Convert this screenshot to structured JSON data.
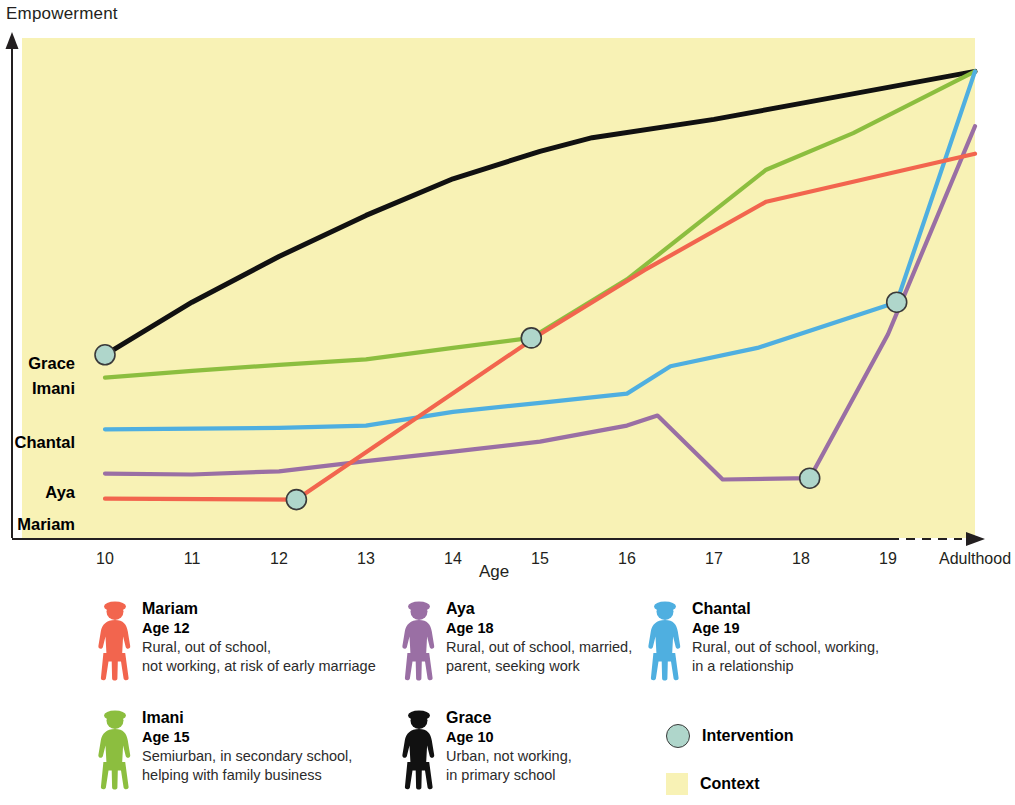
{
  "axes": {
    "y_title": "Empowerment",
    "x_title": "Age"
  },
  "chart_data": {
    "type": "line",
    "title": "Empowerment",
    "xlabel": "Age",
    "ylabel": "Empowerment",
    "x_tick_labels": [
      "10",
      "11",
      "12",
      "13",
      "14",
      "15",
      "16",
      "17",
      "18",
      "19",
      "Adulthood"
    ],
    "xlim": [
      10,
      20
    ],
    "ylim": [
      0,
      1
    ],
    "grid": false,
    "legend_position": "below",
    "background_color": "#F8F2B5",
    "annotations": [
      {
        "label": "Intervention",
        "marker": "circle",
        "fill": "#AFD6CB",
        "stroke": "#3a3a3a"
      },
      {
        "label": "Context",
        "marker": "square",
        "fill": "#F8F2B5"
      }
    ],
    "series": [
      {
        "name": "Grace",
        "color": "#111111",
        "inline_label": "Grace",
        "points": [
          [
            10,
            0.355
          ],
          [
            11,
            0.47
          ],
          [
            12,
            0.57
          ],
          [
            13,
            0.66
          ],
          [
            14,
            0.74
          ],
          [
            15,
            0.8
          ],
          [
            15.6,
            0.83
          ],
          [
            17,
            0.87
          ],
          [
            18,
            0.905
          ],
          [
            19,
            0.94
          ],
          [
            20,
            0.975
          ]
        ],
        "intervention_points": [
          [
            10,
            0.355
          ]
        ]
      },
      {
        "name": "Imani",
        "color": "#8CBE3F",
        "inline_label": "Imani",
        "points": [
          [
            10,
            0.305
          ],
          [
            11,
            0.32
          ],
          [
            12,
            0.333
          ],
          [
            13,
            0.345
          ],
          [
            14,
            0.37
          ],
          [
            14.9,
            0.392
          ],
          [
            16,
            0.52
          ],
          [
            17.6,
            0.76
          ],
          [
            18.6,
            0.84
          ],
          [
            20,
            0.975
          ]
        ],
        "intervention_points": [
          [
            14.9,
            0.392
          ]
        ]
      },
      {
        "name": "Chantal",
        "color": "#4FAFE0",
        "inline_label": "Chantal",
        "points": [
          [
            10,
            0.192
          ],
          [
            12,
            0.195
          ],
          [
            13,
            0.2
          ],
          [
            14,
            0.23
          ],
          [
            15,
            0.25
          ],
          [
            16,
            0.27
          ],
          [
            16.5,
            0.33
          ],
          [
            17.5,
            0.37
          ],
          [
            19.1,
            0.47
          ],
          [
            20,
            0.975
          ]
        ],
        "intervention_points": [
          [
            19.1,
            0.47
          ]
        ]
      },
      {
        "name": "Aya",
        "color": "#9A6FA4",
        "inline_label": "Aya",
        "points": [
          [
            10,
            0.095
          ],
          [
            11,
            0.093
          ],
          [
            12,
            0.1
          ],
          [
            13,
            0.122
          ],
          [
            14,
            0.143
          ],
          [
            15,
            0.165
          ],
          [
            16,
            0.2
          ],
          [
            16.35,
            0.222
          ],
          [
            17.1,
            0.082
          ],
          [
            18.1,
            0.085
          ],
          [
            19,
            0.4
          ],
          [
            20,
            0.855
          ]
        ],
        "intervention_points": [
          [
            18.1,
            0.085
          ]
        ]
      },
      {
        "name": "Mariam",
        "color": "#F2654E",
        "inline_label": "Mariam",
        "points": [
          [
            10,
            0.04
          ],
          [
            12.2,
            0.038
          ],
          [
            15,
            0.4
          ],
          [
            16.2,
            0.54
          ],
          [
            17.6,
            0.69
          ],
          [
            20,
            0.795
          ]
        ],
        "intervention_points": [
          [
            12.2,
            0.038
          ]
        ]
      }
    ]
  },
  "series_labels": [
    {
      "text": "Grace"
    },
    {
      "text": "Imani"
    },
    {
      "text": "Chantal"
    },
    {
      "text": "Aya"
    },
    {
      "text": "Mariam"
    }
  ],
  "legend": {
    "people": [
      {
        "name": "Mariam",
        "age": "Age 12",
        "desc_lines": [
          "Rural, out of school,",
          "not working, at risk of early marriage"
        ],
        "color": "#F2654E"
      },
      {
        "name": "Aya",
        "age": "Age 18",
        "desc_lines": [
          "Rural, out of school, married,",
          "parent, seeking work"
        ],
        "color": "#9A6FA4"
      },
      {
        "name": "Chantal",
        "age": "Age 19",
        "desc_lines": [
          "Rural, out of school, working,",
          "in a relationship"
        ],
        "color": "#4FAFE0"
      },
      {
        "name": "Imani",
        "age": "Age 15",
        "desc_lines": [
          "Semiurban, in secondary school,",
          "helping with family business"
        ],
        "color": "#8CBE3F"
      },
      {
        "name": "Grace",
        "age": "Age 10",
        "desc_lines": [
          "Urban, not working,",
          "in primary school"
        ],
        "color": "#111111"
      }
    ],
    "keys": [
      {
        "label": "Intervention",
        "shape": "circle"
      },
      {
        "label": "Context",
        "shape": "square"
      }
    ]
  }
}
